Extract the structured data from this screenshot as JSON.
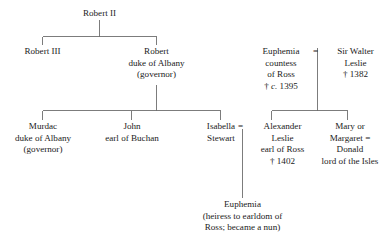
{
  "diagram": {
    "type": "genealogical-family-tree",
    "line_color": "#6e6e6e",
    "text_color": "#1a1a1a",
    "background": "#ffffff",
    "marriage_symbol": "=",
    "death_symbol": "†"
  },
  "nodes": {
    "robert_ii": {
      "l1": "Robert II"
    },
    "robert_iii": {
      "l1": "Robert III"
    },
    "robert_albany": {
      "l1": "Robert",
      "l2": "duke of Albany",
      "l3": "(governor)"
    },
    "euphemia_ross": {
      "l1": "Euphemia",
      "l2": "countess",
      "l3": "of Ross",
      "l4": "† c. 1395"
    },
    "walter_leslie": {
      "l1": "Sir Walter",
      "l2": "Leslie",
      "l3": "† 1382"
    },
    "murdac": {
      "l1": "Murdac",
      "l2": "duke of Albany",
      "l3": "(governor)"
    },
    "john_buchan": {
      "l1": "John",
      "l2": "earl of Buchan"
    },
    "isabella_stewart": {
      "l1": "Isabella",
      "l2": "Stewart"
    },
    "alexander_leslie": {
      "l1": "Alexander",
      "l2": "Leslie",
      "l3": "earl of Ross",
      "l4": "† 1402"
    },
    "mary_margaret": {
      "l1": "Mary or",
      "l2": "Margaret =",
      "l3": "Donald",
      "l4": "lord of the Isles"
    },
    "euphemia_heiress": {
      "l1": "Euphemia",
      "l2": "(heiress to earldom of",
      "l3": "Ross; became a nun)"
    }
  },
  "marriages": [
    {
      "name": "euphemia-walter-marriage",
      "symbol": "="
    },
    {
      "name": "isabella-alexander-marriage",
      "symbol": "="
    }
  ]
}
